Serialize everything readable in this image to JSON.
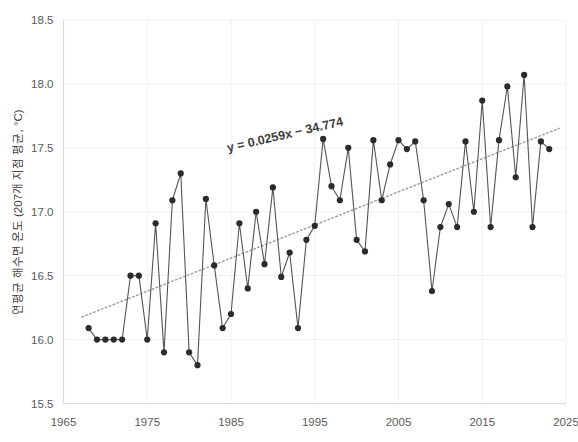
{
  "chart_data": {
    "type": "line",
    "title": "",
    "subtitle": "",
    "xlabel": "",
    "ylabel": "연평균 해수면 온도 (207개 지점 평균, °C)",
    "xlim": [
      1965,
      2025
    ],
    "ylim": [
      15.5,
      18.5
    ],
    "xticks": [
      1965,
      1975,
      1985,
      1995,
      2005,
      2015,
      2025
    ],
    "yticks": [
      15.5,
      16.0,
      16.5,
      17.0,
      17.5,
      18.0,
      18.5
    ],
    "xtick_labels": [
      "1965",
      "1975",
      "1985",
      "1995",
      "2005",
      "2015",
      "2025"
    ],
    "ytick_labels": [
      "15.5",
      "16.0",
      "16.5",
      "17.0",
      "17.5",
      "18.0",
      "18.5"
    ],
    "grid": true,
    "legend": "none",
    "marker": "circle",
    "series": [
      {
        "name": "연평균 해수면 온도",
        "x": [
          1968,
          1969,
          1970,
          1971,
          1972,
          1973,
          1974,
          1975,
          1976,
          1977,
          1978,
          1979,
          1980,
          1981,
          1982,
          1983,
          1984,
          1985,
          1986,
          1987,
          1988,
          1989,
          1990,
          1991,
          1992,
          1993,
          1994,
          1995,
          1996,
          1997,
          1998,
          1999,
          2000,
          2001,
          2002,
          2003,
          2004,
          2005,
          2006,
          2007,
          2008,
          2009,
          2010,
          2011,
          2012,
          2013,
          2014,
          2015,
          2016,
          2017,
          2018,
          2019,
          2020,
          2021,
          2022,
          2023
        ],
        "values": [
          16.09,
          16.0,
          16.0,
          16.0,
          16.0,
          16.5,
          16.5,
          16.0,
          16.91,
          15.9,
          17.09,
          17.3,
          15.9,
          15.8,
          17.1,
          16.58,
          16.09,
          16.2,
          16.91,
          16.4,
          17.0,
          16.59,
          17.19,
          16.49,
          16.68,
          16.09,
          16.78,
          16.89,
          17.57,
          17.2,
          17.09,
          17.5,
          16.78,
          16.69,
          17.56,
          17.09,
          17.37,
          17.56,
          17.49,
          17.55,
          17.09,
          16.38,
          16.88,
          17.06,
          16.88,
          17.55,
          17.0,
          17.87,
          16.88,
          17.56,
          17.98,
          17.27,
          18.07,
          16.88,
          17.55,
          17.49
        ],
        "color": "#555555"
      }
    ],
    "trendline": {
      "equation": "y = 0.0259x − 34.774",
      "slope": 0.0259,
      "intercept": -34.774,
      "style": "dotted",
      "color": "#9a9a9a",
      "label_rotation": -13
    }
  },
  "axis": {
    "y_title": "연평균 해수면 온도 (207개 지점 평균, °C)"
  }
}
